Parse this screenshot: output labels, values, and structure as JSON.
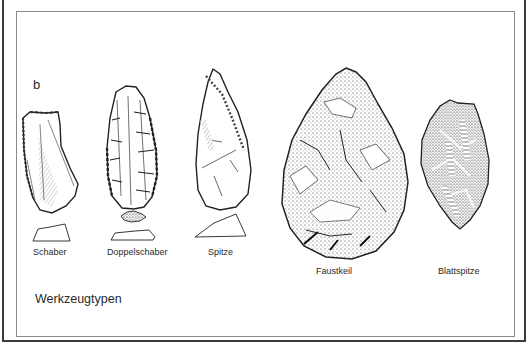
{
  "figure": {
    "panel_letter": "b",
    "caption": "Werkzeugtypen",
    "tools": [
      {
        "name": "Schaber",
        "label": "Schaber",
        "has_cross_section": true
      },
      {
        "name": "Doppelschaber",
        "label": "Doppelschaber",
        "has_cross_section": true
      },
      {
        "name": "Spitze",
        "label": "Spitze",
        "has_cross_section": true
      },
      {
        "name": "Faustkeil",
        "label": "Faustkeil",
        "has_cross_section": false
      },
      {
        "name": "Blattspitze",
        "label": "Blattspitze",
        "has_cross_section": false
      }
    ],
    "colors": {
      "background": "#ffffff",
      "outer_frame": "#3a3a3a",
      "inner_frame": "#8a8a8a",
      "ink": "#222222"
    }
  }
}
